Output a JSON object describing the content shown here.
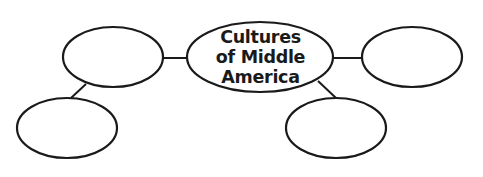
{
  "diagram": {
    "type": "web-organizer",
    "center": {
      "lines": [
        "Cultures",
        "of Middle",
        "America"
      ]
    },
    "nodes": [
      {
        "id": "left-top",
        "label": "",
        "cx": 113,
        "cy": 57,
        "rx": 50,
        "ry": 30
      },
      {
        "id": "left-bottom",
        "label": "",
        "cx": 67,
        "cy": 128,
        "rx": 50,
        "ry": 30
      },
      {
        "id": "right-top",
        "label": "",
        "cx": 412,
        "cy": 57,
        "rx": 50,
        "ry": 30
      },
      {
        "id": "right-bottom",
        "label": "",
        "cx": 336,
        "cy": 128,
        "rx": 50,
        "ry": 30
      }
    ],
    "colors": {
      "stroke": "#1a1a1a",
      "fill": "#ffffff",
      "background": "#ffffff"
    }
  }
}
